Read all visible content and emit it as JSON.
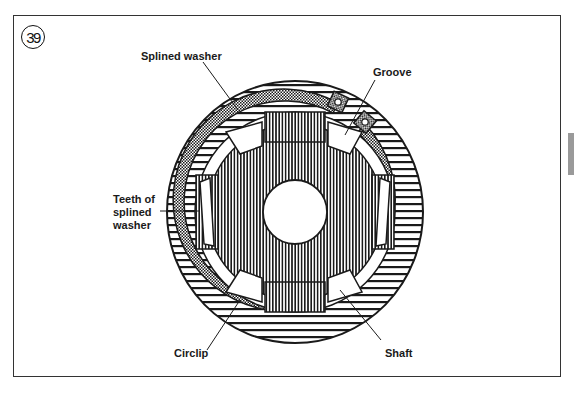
{
  "figure": {
    "number": "39",
    "labels": {
      "splined_washer": "Splined washer",
      "groove": "Groove",
      "teeth_line1": "Teeth of",
      "teeth_line2": "splined",
      "teeth_line3": "washer",
      "circlip": "Circlip",
      "shaft": "Shaft"
    }
  },
  "geometry": {
    "center": [
      295,
      212
    ],
    "outer_rx": 128,
    "outer_ry": 131,
    "circlip_outer_r": 111,
    "circlip_inner_r": 101,
    "shaft_r": 96,
    "hole_r": 32
  },
  "colors": {
    "ink": "#1a1a1a",
    "paper": "#ffffff",
    "tab": "#9a9a9a"
  }
}
